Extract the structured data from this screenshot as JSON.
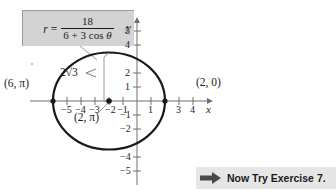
{
  "figure": {
    "equation": {
      "lhs": "r",
      "equals": "=",
      "numerator": "18",
      "denominator_pre": "6 + 3 cos ",
      "denominator_theta": "θ"
    },
    "axes": {
      "x_label": "x",
      "y_label": "y",
      "x_ticks": [
        "−5",
        "−4",
        "−3",
        "−2",
        "−1",
        "1",
        "3",
        "4"
      ],
      "x_tick_values": [
        -5,
        -4,
        -3,
        -2,
        -1,
        1,
        3,
        4
      ],
      "y_ticks": [
        "5",
        "4",
        "2",
        "1",
        "−1",
        "−2",
        "−4",
        "−5"
      ],
      "y_tick_values": [
        5,
        4,
        2,
        1,
        -1,
        -2,
        -4,
        -5
      ],
      "origin_px": [
        137,
        101
      ],
      "unit_px": 14
    },
    "curve": {
      "type": "ellipse",
      "center": [
        -2,
        0
      ],
      "semi_major_x": 4,
      "semi_minor_y": 3.4641,
      "stroke": "#1a1a1a",
      "stroke_width": 2.2
    },
    "annotations": [
      {
        "id": "brace-label",
        "text": "2√3",
        "x_px": 60,
        "y_px": 73
      },
      {
        "id": "point-left",
        "text": "(6, π)",
        "x_px": 4,
        "y_px": 84
      },
      {
        "id": "point-right",
        "text": "(2, 0)",
        "x_px": 196,
        "y_px": 83
      },
      {
        "id": "point-center",
        "text": "(2, π)",
        "x_px": 74,
        "y_px": 114
      }
    ],
    "points": [
      {
        "label": "(6, π)",
        "coords_px": [
          53,
          101
        ]
      },
      {
        "label": "(2, 0)",
        "coords_px": [
          165,
          101
        ]
      },
      {
        "label": "(2, π)",
        "coords_px": [
          109,
          101
        ]
      }
    ]
  },
  "footer": {
    "arrow_icon": "right-arrow-icon",
    "text": "Now Try Exercise 7."
  },
  "colors": {
    "equation_box_bg": "#d3d3d3",
    "footer_bg": "#e6e6e6",
    "curve": "#1a1a1a",
    "axis": "#6e6e6e",
    "arrow": "#4a4a4a"
  }
}
